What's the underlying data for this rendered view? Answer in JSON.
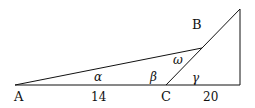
{
  "diagram": {
    "points": {
      "A": {
        "label": "A",
        "x": 15,
        "y": 85
      },
      "C": {
        "label": "C",
        "x": 166,
        "y": 85
      },
      "D": {
        "x": 240,
        "y": 85
      },
      "T": {
        "x": 240,
        "y": 9
      },
      "B": {
        "label": "B",
        "x": 202,
        "y": 48
      }
    },
    "labels": {
      "A": "A",
      "B": "B",
      "C": "C",
      "len_AC": "14",
      "len_CD": "20",
      "alpha": "α",
      "beta": "β",
      "omega": "ω",
      "gamma": "γ"
    },
    "colors": {
      "stroke": "#111111",
      "background": "#ffffff"
    }
  }
}
